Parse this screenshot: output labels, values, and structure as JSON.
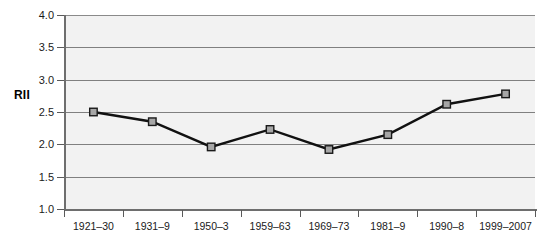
{
  "chart_data": {
    "type": "line",
    "title": "",
    "xlabel": "",
    "ylabel": "RII",
    "ylim": [
      1.0,
      4.0
    ],
    "ytick_step": 0.5,
    "ytick_labels": [
      "1.0",
      "1.5",
      "2.0",
      "2.5",
      "3.0",
      "3.5",
      "4.0"
    ],
    "grid": "horizontal",
    "legend": "none",
    "categories": [
      "1921–30",
      "1931–9",
      "1950–3",
      "1959–63",
      "1969–73",
      "1981–9",
      "1990–8",
      "1999–2007"
    ],
    "series": [
      {
        "name": "RII",
        "marker": "square",
        "marker_fill": "#a6a6a6",
        "marker_edge": "#1a1a1a",
        "line_color": "#111111",
        "values": [
          2.5,
          2.35,
          1.96,
          2.23,
          1.92,
          2.15,
          2.62,
          2.78
        ]
      }
    ],
    "plot_background": "#f2f2f2",
    "gridline_color": "#808080",
    "axis_color": "#6e6e6e",
    "page_background": "#ffffff"
  }
}
